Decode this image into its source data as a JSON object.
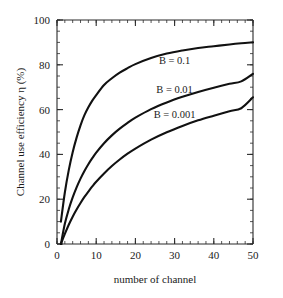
{
  "chart_data": {
    "type": "line",
    "title": "",
    "xlabel": "number of channel",
    "ylabel": "Channel use efficiency η (%)",
    "xlim": [
      0,
      50
    ],
    "ylim": [
      0,
      100
    ],
    "xticks": [
      0,
      10,
      20,
      30,
      40,
      50
    ],
    "yticks": [
      0,
      20,
      40,
      60,
      80,
      100
    ],
    "xtick_labels": [
      "0",
      "10",
      "20",
      "30",
      "40",
      "50"
    ],
    "ytick_labels": [
      "0",
      "20",
      "40",
      "60",
      "80",
      "100"
    ],
    "x_minor_step": 2,
    "y_minor_step": 5,
    "grid": false,
    "legend_position": "inline-right",
    "line_color": "#111111",
    "frame_color": "#2b2b2b",
    "background_color": "#ffffff",
    "series": [
      {
        "name": "B = 0.1",
        "label": "B = 0.1",
        "label_x": 30,
        "label_y": 82,
        "x": [
          1,
          2,
          3,
          4,
          5,
          6,
          7,
          8,
          9,
          10,
          12,
          14,
          16,
          18,
          20,
          24,
          28,
          32,
          36,
          40,
          44,
          47,
          50
        ],
        "values": [
          10.0,
          23.0,
          33.0,
          41.0,
          47.5,
          53.0,
          57.5,
          61.0,
          64.0,
          66.5,
          71.0,
          74.0,
          76.5,
          78.5,
          80.3,
          83.0,
          85.0,
          86.4,
          87.5,
          88.3,
          89.1,
          89.6,
          90.0
        ]
      },
      {
        "name": "B = 0.01",
        "label": "B = 0.01",
        "label_x": 30,
        "label_y": 69,
        "x": [
          1,
          2,
          3,
          4,
          5,
          6,
          7,
          8,
          9,
          10,
          12,
          14,
          16,
          18,
          20,
          24,
          28,
          32,
          36,
          40,
          44,
          47,
          50
        ],
        "values": [
          0.0,
          9.0,
          15.5,
          20.8,
          25.3,
          29.2,
          32.6,
          35.6,
          38.3,
          40.8,
          45.0,
          48.5,
          51.5,
          54.1,
          56.4,
          60.2,
          63.2,
          65.7,
          67.9,
          69.8,
          71.5,
          72.6,
          76.0
        ]
      },
      {
        "name": "B = 0.001",
        "label": "B = 0.001",
        "label_x": 30,
        "label_y": 58,
        "x": [
          1,
          2,
          3,
          4,
          5,
          6,
          7,
          8,
          9,
          10,
          12,
          14,
          16,
          18,
          20,
          24,
          28,
          32,
          36,
          40,
          44,
          47,
          50
        ],
        "values": [
          0.0,
          4.5,
          8.6,
          12.2,
          15.4,
          18.3,
          21.0,
          23.4,
          25.7,
          27.8,
          31.5,
          34.8,
          37.7,
          40.3,
          42.6,
          46.6,
          49.9,
          52.7,
          55.2,
          57.3,
          59.3,
          60.6,
          65.5
        ]
      }
    ]
  },
  "figure": {
    "name": "channel-use-efficiency-chart"
  }
}
